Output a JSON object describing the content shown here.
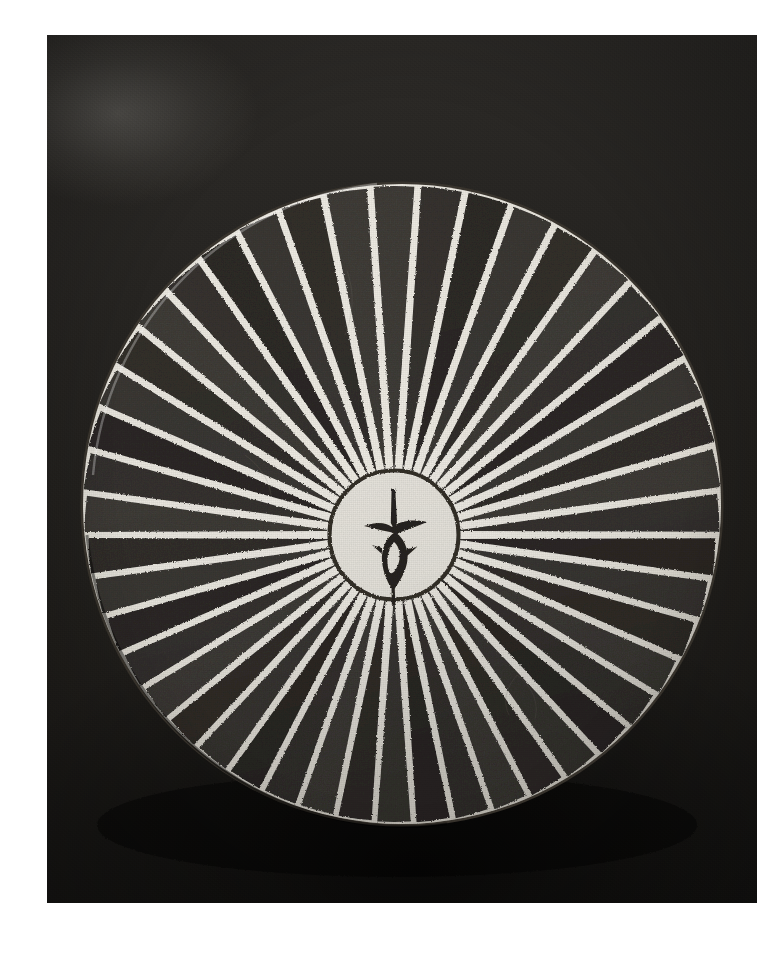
{
  "page": {
    "width": 772,
    "height": 953,
    "background_color": "#ffffff",
    "caption": ""
  },
  "photograph": {
    "title": "Ceramic bowl with radiating stripe decoration",
    "medium_note": "black-and-white photograph",
    "frame": {
      "left": 47,
      "top": 35,
      "width": 710,
      "height": 868
    },
    "background": {
      "description": "dark textured cloth ground",
      "color": "#262421",
      "highlight_color": "#b4b2ac",
      "shadow_color": "#000000",
      "highlight_label": "upper-left light flare",
      "shadow_label": "cast shadow beneath bowl"
    }
  },
  "object": {
    "name": "striped bowl",
    "form": "shallow open bowl seen from above, slightly tilted",
    "rim": {
      "center_x": 355,
      "center_y": 469,
      "radius_x": 320,
      "radius_y": 321,
      "rim_line_color": "#2b2722",
      "label": "bowl rim"
    },
    "ground_color": "#ece9e1",
    "slip_color": "#f2efe8",
    "stripe_color": "#2a2622",
    "stripe_count": 46,
    "stripe_label": "radiating dark stripe",
    "stripe_inner_radius": 63,
    "stripe_outer_radius": 318,
    "stripe_outer_half_angle_deg": 3.35,
    "stripe_inner_half_angle_deg": 0.38,
    "medallion": {
      "center_x": 347,
      "center_y": 500,
      "radius": 63,
      "ring_color": "#35302a",
      "fill_color": "#f1eee6",
      "label": "central medallion"
    },
    "motif": {
      "label": "central calligraphic motif",
      "description": "vertical stem with flared horizontal bar and almond-shaped loop below",
      "color": "#2b2722"
    }
  },
  "chart_data": {
    "type": "pie",
    "categories": [
      "dark stripe",
      "light ground"
    ],
    "values": [
      46,
      46
    ]
  }
}
